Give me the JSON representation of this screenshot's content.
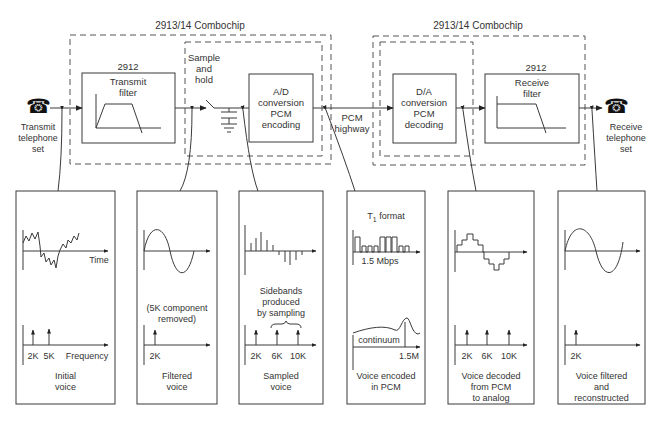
{
  "colors": {
    "stroke": "#3a3a3a",
    "dash": "#555555",
    "background": "#ffffff"
  },
  "header": {
    "left_chip_title": "2913/14 Combochip",
    "right_chip_title": "2913/14 Combochip"
  },
  "transmit_phone": {
    "icon": "telephone-icon",
    "label_lines": [
      "Transmit",
      "telephone",
      "set"
    ]
  },
  "receive_phone": {
    "icon": "telephone-icon",
    "label_lines": [
      "Receive",
      "telephone",
      "set"
    ]
  },
  "blocks": {
    "transmit_filter": {
      "part": "2912",
      "title_lines": [
        "Transmit",
        "filter"
      ]
    },
    "sample_hold": {
      "title_lines": [
        "Sample",
        "and",
        "hold"
      ]
    },
    "ad": {
      "title_lines": [
        "A/D",
        "conversion",
        "PCM",
        "encoding"
      ]
    },
    "pcm_highway": {
      "title_lines": [
        "PCM",
        "highway"
      ]
    },
    "da": {
      "title_lines": [
        "D/A",
        "conversion",
        "PCM",
        "decoding"
      ]
    },
    "receive_filter": {
      "part": "2912",
      "title_lines": [
        "Receive",
        "filter"
      ]
    }
  },
  "panels": [
    {
      "id": "initial",
      "time_label": "Time",
      "freq_label": "Frequency",
      "freq_ticks": [
        "2K",
        "5K"
      ],
      "caption_lines": [
        "Initial",
        "voice"
      ]
    },
    {
      "id": "filtered",
      "note_lines": [
        "(5K component",
        "removed)"
      ],
      "freq_ticks": [
        "2K"
      ],
      "caption_lines": [
        "Filtered",
        "voice"
      ]
    },
    {
      "id": "sampled",
      "note_lines": [
        "Sidebands",
        "produced",
        "by sampling"
      ],
      "freq_ticks": [
        "2K",
        "6K",
        "10K"
      ],
      "caption_lines": [
        "Sampled",
        "voice"
      ]
    },
    {
      "id": "pcm",
      "title": "T1 format",
      "title_main": "T",
      "title_sub": "1",
      "title_rest": " format",
      "rate_label": "1.5 Mbps",
      "spectrum_label": "continuum",
      "freq_ticks": [
        "1.5M"
      ],
      "caption_lines": [
        "Voice encoded",
        "in PCM"
      ]
    },
    {
      "id": "decoded",
      "freq_ticks": [
        "2K",
        "6K",
        "10K"
      ],
      "caption_lines": [
        "Voice decoded",
        "from PCM",
        "to analog"
      ]
    },
    {
      "id": "reconstructed",
      "freq_ticks": [
        "2K"
      ],
      "caption_lines": [
        "Voice filtered",
        "and",
        "reconstructed"
      ]
    }
  ]
}
